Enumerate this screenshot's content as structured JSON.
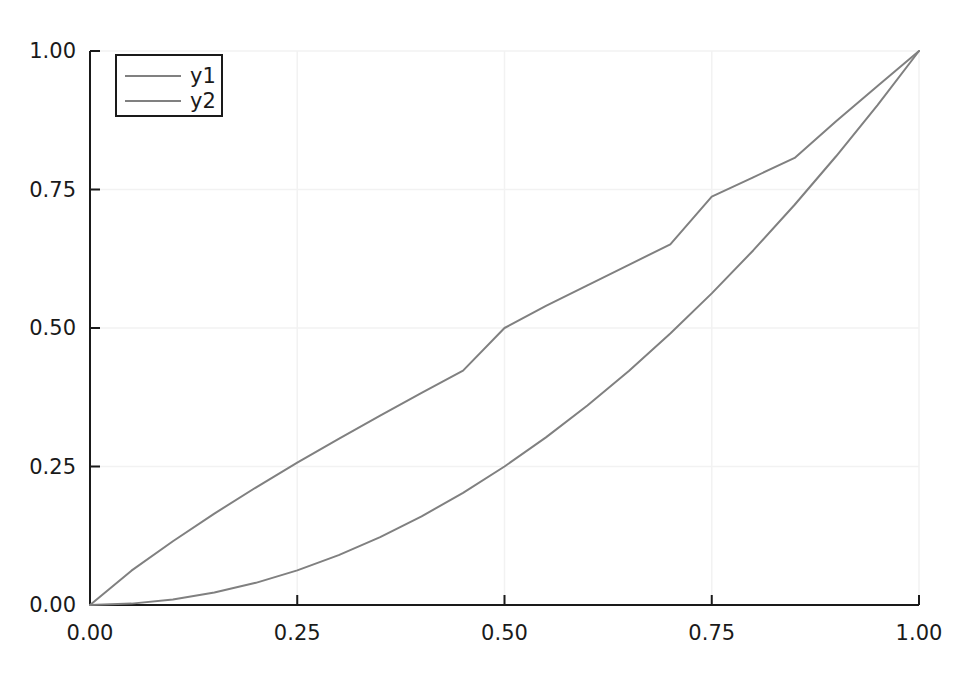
{
  "chart_data": {
    "type": "line",
    "title": "",
    "xlabel": "",
    "ylabel": "",
    "xlim": [
      0.0,
      1.0
    ],
    "ylim": [
      0.0,
      1.0
    ],
    "grid": true,
    "legend_position": "top-left",
    "xticks": [
      "0.00",
      "0.25",
      "0.50",
      "0.75",
      "1.00"
    ],
    "xtick_values": [
      0.0,
      0.25,
      0.5,
      0.75,
      1.0
    ],
    "yticks": [
      "0.00",
      "0.25",
      "0.50",
      "0.75",
      "1.00"
    ],
    "ytick_values": [
      0.0,
      0.25,
      0.5,
      0.75,
      1.0
    ],
    "x": [
      0.0,
      0.05,
      0.1,
      0.15,
      0.2,
      0.25,
      0.3,
      0.35,
      0.4,
      0.45,
      0.5,
      0.55,
      0.6,
      0.65,
      0.7,
      0.75,
      0.8,
      0.85,
      0.9,
      0.95,
      1.0
    ],
    "series": [
      {
        "name": "y1",
        "color": "#808080",
        "linewidth": 2,
        "values": [
          0.0,
          0.062,
          0.115,
          0.165,
          0.212,
          0.257,
          0.3,
          0.342,
          0.383,
          0.423,
          0.5,
          0.54,
          0.577,
          0.614,
          0.651,
          0.737,
          0.772,
          0.807,
          0.873,
          0.937,
          1.0
        ]
      },
      {
        "name": "y2",
        "color": "#808080",
        "linewidth": 2,
        "values": [
          0.0,
          0.0025,
          0.01,
          0.0225,
          0.04,
          0.0625,
          0.09,
          0.1225,
          0.16,
          0.2025,
          0.25,
          0.3025,
          0.36,
          0.4225,
          0.49,
          0.5625,
          0.64,
          0.7225,
          0.81,
          0.9025,
          1.0
        ]
      }
    ]
  },
  "legend": {
    "entries": [
      {
        "label": "y1"
      },
      {
        "label": "y2"
      }
    ]
  },
  "axes": {
    "axis_color": "#1a1a1a",
    "grid_color": "#f2f2f2",
    "background": "#ffffff"
  }
}
